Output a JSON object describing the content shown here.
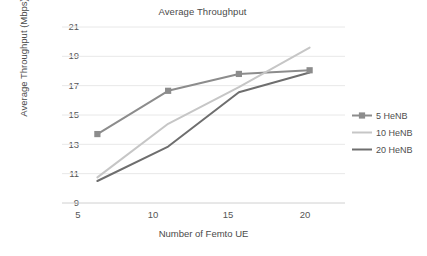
{
  "chart_data": {
    "type": "line",
    "title": "Average Throughput",
    "xlabel": "Number of Femto UE",
    "ylabel": "Average Throughput (Mbps)",
    "x": [
      5,
      10,
      15,
      20
    ],
    "xticklabels": [
      "5",
      "10",
      "15",
      "20"
    ],
    "yticklabels": [
      "9",
      "11",
      "13",
      "15",
      "17",
      "19",
      "21"
    ],
    "yticks": [
      9,
      11,
      13,
      15,
      17,
      19,
      21
    ],
    "xlim": [
      2.5,
      22.5
    ],
    "ylim": [
      9,
      21
    ],
    "grid": "horizontal",
    "legend_position": "right",
    "series": [
      {
        "name": "5 HeNB",
        "color": "#8c8c8c",
        "marker": "square",
        "values": [
          13.7,
          16.65,
          17.8,
          18.05
        ]
      },
      {
        "name": "10 HeNB",
        "color": "#c6c6c6",
        "marker": "none",
        "values": [
          10.75,
          14.4,
          16.9,
          19.6
        ]
      },
      {
        "name": "20 HeNB",
        "color": "#6e6e6e",
        "marker": "none",
        "values": [
          10.5,
          12.85,
          16.55,
          17.9
        ]
      }
    ]
  },
  "axes": {
    "y_labels": [
      {
        "text": "21",
        "top": "22"
      },
      {
        "text": "19",
        "top": "51"
      },
      {
        "text": "17",
        "top": "81"
      },
      {
        "text": "15",
        "top": "110"
      },
      {
        "text": "13",
        "top": "140"
      },
      {
        "text": "11",
        "top": "169"
      },
      {
        "text": "9",
        "top": "198"
      }
    ],
    "x_labels": [
      {
        "text": "5",
        "left": "61"
      },
      {
        "text": "10",
        "left": "136"
      },
      {
        "text": "15",
        "left": "211"
      },
      {
        "text": "20",
        "left": "288"
      }
    ]
  },
  "colors": {
    "gridline": "#e8e8e8",
    "axis": "#d0d0d0",
    "text": "#4a4a4a",
    "background": "#ffffff"
  }
}
